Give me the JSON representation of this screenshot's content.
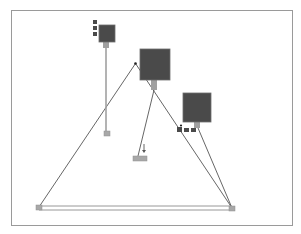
{
  "diagram": {
    "frame": {
      "x": 11,
      "y": 10,
      "w": 282,
      "h": 216
    },
    "colors": {
      "node_dark": "#4a4a4a",
      "node_mid": "#6e6e6e",
      "stem": "#a0a0a0",
      "anchor": "#a8a8a8",
      "line": "#555555",
      "light_line": "#8c8c8c"
    },
    "large_nodes": [
      {
        "id": "node-a",
        "x": 99,
        "y": 25,
        "w": 16,
        "h": 17
      },
      {
        "id": "node-b",
        "x": 140,
        "y": 49,
        "w": 30,
        "h": 31
      },
      {
        "id": "node-c",
        "x": 183,
        "y": 93,
        "w": 28,
        "h": 29
      }
    ],
    "stems": [
      {
        "id": "stem-a",
        "x": 103,
        "y": 42,
        "w": 6,
        "h": 6
      },
      {
        "id": "stem-b",
        "x": 151,
        "y": 80,
        "w": 6,
        "h": 10
      },
      {
        "id": "stem-c",
        "x": 194,
        "y": 122,
        "w": 6,
        "h": 6
      }
    ],
    "small_squares": [
      {
        "id": "sq-a1",
        "x": 93,
        "y": 20,
        "w": 4,
        "h": 4
      },
      {
        "id": "sq-a2",
        "x": 93,
        "y": 26,
        "w": 4,
        "h": 4
      },
      {
        "id": "sq-a3",
        "x": 93,
        "y": 32,
        "w": 4,
        "h": 4
      },
      {
        "id": "sq-c1",
        "x": 177,
        "y": 127,
        "w": 5,
        "h": 5
      },
      {
        "id": "sq-c2",
        "x": 184,
        "y": 128,
        "w": 5,
        "h": 4
      },
      {
        "id": "sq-c3",
        "x": 191,
        "y": 128,
        "w": 5,
        "h": 4
      }
    ],
    "anchors": [
      {
        "id": "anchor-left",
        "x": 36,
        "y": 205,
        "w": 6,
        "h": 5
      },
      {
        "id": "anchor-right",
        "x": 229,
        "y": 206,
        "w": 6,
        "h": 5
      },
      {
        "id": "anchor-mid",
        "x": 104,
        "y": 131,
        "w": 6,
        "h": 5
      },
      {
        "id": "anchor-bottom",
        "x": 133,
        "y": 156,
        "w": 14,
        "h": 5
      }
    ],
    "dots": [
      {
        "id": "apex-dot",
        "cx": 135.5,
        "cy": 63.5,
        "r": 1.3
      },
      {
        "id": "dot-c",
        "cx": 181,
        "cy": 125.5,
        "r": 1.1
      }
    ],
    "lines": [
      {
        "id": "tri-left",
        "x1": 39,
        "y1": 207,
        "x2": 135.5,
        "y2": 63.5,
        "kind": "line"
      },
      {
        "id": "tri-right",
        "x1": 135.5,
        "y1": 63.5,
        "x2": 232,
        "y2": 208,
        "kind": "line"
      },
      {
        "id": "c-link",
        "x1": 198,
        "y1": 128,
        "x2": 232,
        "y2": 208,
        "kind": "line"
      },
      {
        "id": "b-link",
        "x1": 154,
        "y1": 90,
        "x2": 138,
        "y2": 156,
        "kind": "line"
      },
      {
        "id": "a-link",
        "x1": 106,
        "y1": 48,
        "x2": 106,
        "y2": 131,
        "kind": "stem"
      },
      {
        "id": "base-top",
        "x1": 39,
        "y1": 206,
        "x2": 232,
        "y2": 206,
        "kind": "light"
      },
      {
        "id": "base-bottom",
        "x1": 39,
        "y1": 210,
        "x2": 232,
        "y2": 210,
        "kind": "light"
      },
      {
        "id": "arrow-stem",
        "x1": 144,
        "y1": 144,
        "x2": 144,
        "y2": 151,
        "kind": "line"
      }
    ],
    "arrow": {
      "id": "arrow-down",
      "x": 144,
      "y": 152
    }
  }
}
